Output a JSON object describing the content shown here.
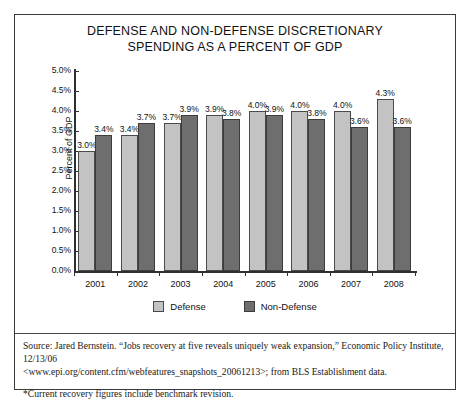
{
  "document": {
    "title_line_1": "DEFENSE AND NON-DEFENSE DISCRETIONARY",
    "title_line_2": "SPENDING AS A PERCENT OF GDP",
    "source_line_1": "Source: Jared Bernstein. “Jobs recovery at five reveals uniquely weak expansion,” Economic Policy Institute, 12/13/06",
    "source_line_2": "<www.epi.org/content.cfm/webfeatures_snapshots_20061213>; from BLS Establishment data.",
    "footnote": "*Current recovery figures include benchmark revision."
  },
  "colors": {
    "defense": "#c3c3c3",
    "non_defense": "#6e6e6e",
    "axis": "#2f2f2f",
    "frame": "#3a3a3a",
    "text": "#111111"
  },
  "chart_data": {
    "type": "bar",
    "title": "DEFENSE AND NON-DEFENSE DISCRETIONARY SPENDING AS A PERCENT OF GDP",
    "xlabel": "",
    "ylabel": "Percent of GDP",
    "ylim": [
      0,
      5
    ],
    "ytick_labels": [
      "0.0%",
      "0.5%",
      "1.0%",
      "1.5%",
      "2.0%",
      "2.5%",
      "3.0%",
      "3.5%",
      "4.0%",
      "4.5%",
      "5.0%"
    ],
    "ytick_values": [
      0,
      0.5,
      1.0,
      1.5,
      2.0,
      2.5,
      3.0,
      3.5,
      4.0,
      4.5,
      5.0
    ],
    "grid": false,
    "legend_position": "bottom-center",
    "categories": [
      "2001",
      "2002",
      "2003",
      "2004",
      "2005",
      "2006",
      "2007",
      "2008"
    ],
    "series": [
      {
        "name": "Defense",
        "color": "#c3c3c3",
        "values": [
          3.0,
          3.4,
          3.7,
          3.9,
          4.0,
          4.0,
          4.0,
          4.3
        ],
        "labels": [
          "3.0%",
          "3.4%",
          "3.7%",
          "3.9%",
          "4.0%",
          "4.0%",
          "4.0%",
          "4.3%"
        ]
      },
      {
        "name": "Non-Defense",
        "color": "#6e6e6e",
        "values": [
          3.4,
          3.7,
          3.9,
          3.8,
          3.9,
          3.8,
          3.6,
          3.6
        ],
        "labels": [
          "3.4%",
          "3.7%",
          "3.9%",
          "3.8%",
          "3.9%",
          "3.8%",
          "3.6%",
          "3.6%"
        ]
      }
    ]
  }
}
